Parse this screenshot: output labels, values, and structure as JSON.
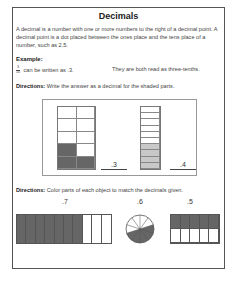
{
  "title": "Decimals",
  "intro": "A decimal is a number with one or more numbers to the right of a decimal point. A decimal point is a dot placed between the ones place and the tens place of a number, such as 2.5.",
  "example": {
    "label": "Example:",
    "fraction_numerator": "3",
    "fraction_denominator": "10",
    "left_text": "can be written as .3.",
    "right_text": "They are both read as three-tenths."
  },
  "directions1": {
    "label": "Directions:",
    "text": " Write the answer as a decimal for the shaded parts."
  },
  "exercise1": {
    "grid_answer": ".3",
    "bar_answer": ".4"
  },
  "directions2": {
    "label": "Directions:",
    "text": " Color parts of each object to match the decimals given."
  },
  "exercise2": {
    "bar_label": ".7",
    "circle_label": ".6",
    "rect_label": ".5"
  },
  "colors": {
    "dark_shade": "#666666",
    "light_shade": "#c8c8c8",
    "border": "#555555"
  }
}
